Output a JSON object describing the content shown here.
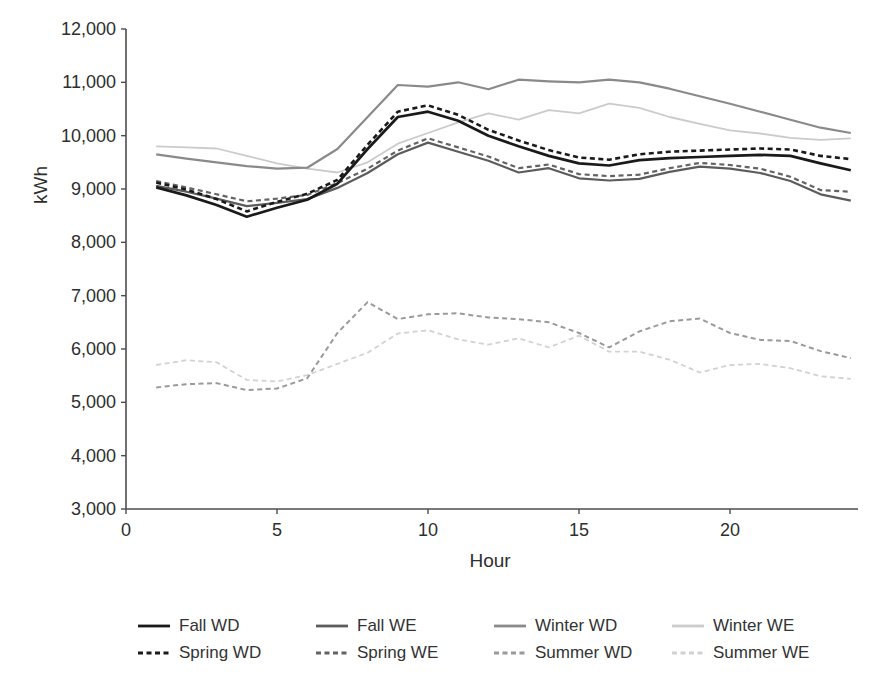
{
  "chart_data": {
    "type": "line",
    "title": "",
    "xlabel": "Hour",
    "ylabel": "kWh",
    "x": [
      1,
      2,
      3,
      4,
      5,
      6,
      7,
      8,
      9,
      10,
      11,
      12,
      13,
      14,
      15,
      16,
      17,
      18,
      19,
      20,
      21,
      22,
      23,
      24
    ],
    "xlim": [
      0,
      24.3
    ],
    "ylim": [
      3000,
      12000
    ],
    "x_ticks": [
      0,
      5,
      10,
      15,
      20
    ],
    "x_tick_labels": [
      "0",
      "5",
      "10",
      "15",
      "20"
    ],
    "y_ticks": [
      3000,
      4000,
      5000,
      6000,
      7000,
      8000,
      9000,
      10000,
      11000,
      12000
    ],
    "y_tick_labels": [
      "3,000",
      "4,000",
      "5,000",
      "6,000",
      "7,000",
      "8,000",
      "9,000",
      "10,000",
      "11,000",
      "12,000"
    ],
    "grid": false,
    "legend_position": "bottom",
    "series": [
      {
        "name": "Winter WE",
        "color": "#cbcbcb",
        "dashed": false,
        "width": 1.8,
        "values": [
          9800,
          9780,
          9760,
          9620,
          9480,
          9380,
          9310,
          9500,
          9850,
          10050,
          10250,
          10420,
          10300,
          10480,
          10420,
          10600,
          10520,
          10350,
          10220,
          10100,
          10040,
          9960,
          9920,
          9950
        ]
      },
      {
        "name": "Summer WE",
        "color": "#d2d2d2",
        "dashed": true,
        "width": 1.8,
        "values": [
          5700,
          5790,
          5750,
          5420,
          5390,
          5510,
          5720,
          5930,
          6290,
          6350,
          6180,
          6080,
          6200,
          6030,
          6250,
          5950,
          5950,
          5800,
          5560,
          5700,
          5720,
          5640,
          5490,
          5440
        ]
      },
      {
        "name": "Summer WD",
        "color": "#9a9a9a",
        "dashed": true,
        "width": 2,
        "values": [
          5280,
          5340,
          5360,
          5230,
          5260,
          5450,
          6300,
          6880,
          6560,
          6650,
          6670,
          6590,
          6560,
          6500,
          6300,
          6030,
          6330,
          6520,
          6570,
          6300,
          6170,
          6150,
          5960,
          5830
        ]
      },
      {
        "name": "Winter WD",
        "color": "#8a8a8a",
        "dashed": false,
        "width": 2.2,
        "values": [
          9650,
          9570,
          9500,
          9430,
          9380,
          9400,
          9750,
          10350,
          10950,
          10920,
          11000,
          10870,
          11050,
          11020,
          11000,
          11050,
          11000,
          10880,
          10740,
          10600,
          10450,
          10300,
          10150,
          10050
        ]
      },
      {
        "name": "Spring WE",
        "color": "#636363",
        "dashed": true,
        "width": 2.2,
        "values": [
          9150,
          9030,
          8900,
          8770,
          8820,
          8890,
          9110,
          9380,
          9720,
          9950,
          9780,
          9610,
          9390,
          9460,
          9280,
          9240,
          9270,
          9390,
          9490,
          9450,
          9380,
          9230,
          8980,
          8950
        ]
      },
      {
        "name": "Fall WE",
        "color": "#5c5c5c",
        "dashed": false,
        "width": 2.2,
        "values": [
          9060,
          8950,
          8820,
          8680,
          8740,
          8810,
          9020,
          9300,
          9650,
          9870,
          9700,
          9530,
          9310,
          9390,
          9200,
          9160,
          9190,
          9320,
          9420,
          9380,
          9300,
          9150,
          8900,
          8780
        ]
      },
      {
        "name": "Spring WD",
        "color": "#1a1a1a",
        "dashed": true,
        "width": 2.6,
        "values": [
          9120,
          8990,
          8810,
          8580,
          8760,
          8910,
          9170,
          9830,
          10450,
          10570,
          10390,
          10110,
          9910,
          9730,
          9590,
          9550,
          9650,
          9700,
          9720,
          9740,
          9760,
          9740,
          9620,
          9560
        ]
      },
      {
        "name": "Fall WD",
        "color": "#1a1a1a",
        "dashed": false,
        "width": 2.7,
        "values": [
          9030,
          8880,
          8700,
          8480,
          8650,
          8800,
          9100,
          9750,
          10350,
          10450,
          10280,
          10000,
          9800,
          9620,
          9480,
          9440,
          9540,
          9580,
          9600,
          9620,
          9640,
          9620,
          9480,
          9350
        ]
      }
    ]
  },
  "axes": {
    "x_label": "Hour",
    "y_label": "kWh"
  },
  "legend": {
    "items": [
      {
        "label": "Fall WD",
        "color": "#1a1a1a",
        "dashed": false
      },
      {
        "label": "Fall WE",
        "color": "#5c5c5c",
        "dashed": false
      },
      {
        "label": "Winter WD",
        "color": "#8a8a8a",
        "dashed": false
      },
      {
        "label": "Winter WE",
        "color": "#cbcbcb",
        "dashed": false
      },
      {
        "label": "Spring WD",
        "color": "#1a1a1a",
        "dashed": true
      },
      {
        "label": "Spring WE",
        "color": "#636363",
        "dashed": true
      },
      {
        "label": "Summer WD",
        "color": "#9a9a9a",
        "dashed": true
      },
      {
        "label": "Summer WE",
        "color": "#d2d2d2",
        "dashed": true
      }
    ]
  }
}
